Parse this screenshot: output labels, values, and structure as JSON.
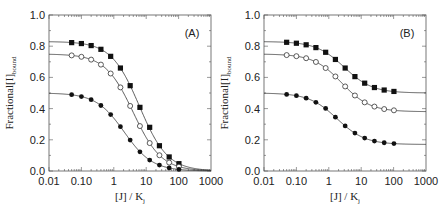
{
  "figure": {
    "panels": [
      {
        "id": "A",
        "label": "(A)"
      },
      {
        "id": "B",
        "label": "(B)"
      }
    ]
  },
  "chart_data": [
    {
      "type": "line",
      "panel_label": "(A)",
      "title": "",
      "xlabel": "[J] / K_J",
      "ylabel": "Fractional[I]_bound",
      "xscale": "log",
      "xlim": [
        0.01,
        1000
      ],
      "ylim": [
        0.0,
        1.0
      ],
      "xticks": [
        0.01,
        0.1,
        1,
        10,
        100,
        1000
      ],
      "xtick_labels": [
        "0.01",
        "0.10",
        "1",
        "10",
        "100",
        "1000"
      ],
      "yticks": [
        0.0,
        0.2,
        0.4,
        0.6,
        0.8,
        1.0
      ],
      "ytick_labels": [
        "0.0",
        "0.2",
        "0.4",
        "0.6",
        "0.8",
        "1.0"
      ],
      "grid": false,
      "legend": null,
      "x": [
        0.05,
        0.1,
        0.2,
        0.4,
        0.8,
        1.6,
        3.2,
        6.4,
        12.8,
        25.6,
        51.2,
        102.4
      ],
      "series": [
        {
          "name": "filled squares",
          "marker": "square-filled",
          "plateau": 0.83,
          "floor": 0.0,
          "midpoint": 6.2,
          "values": [
            0.823,
            0.817,
            0.804,
            0.78,
            0.735,
            0.66,
            0.547,
            0.408,
            0.28,
            0.162,
            0.09,
            0.047
          ]
        },
        {
          "name": "open circles",
          "marker": "circle-open",
          "plateau": 0.75,
          "floor": 0.0,
          "midpoint": 4.0,
          "values": [
            0.741,
            0.732,
            0.714,
            0.682,
            0.625,
            0.536,
            0.417,
            0.288,
            0.179,
            0.101,
            0.054,
            0.028
          ]
        },
        {
          "name": "filled circles",
          "marker": "circle-filled",
          "plateau": 0.5,
          "floor": 0.0,
          "midpoint": 2.1,
          "values": [
            0.489,
            0.477,
            0.457,
            0.42,
            0.362,
            0.284,
            0.198,
            0.123,
            0.07,
            0.038,
            0.02,
            0.01
          ]
        }
      ]
    },
    {
      "type": "line",
      "panel_label": "(B)",
      "title": "",
      "xlabel": "[J] / K_J",
      "ylabel": "Fractional[I]_bound",
      "xscale": "log",
      "xlim": [
        0.01,
        1000
      ],
      "ylim": [
        0.0,
        1.0
      ],
      "xticks": [
        0.01,
        0.1,
        1,
        10,
        100,
        1000
      ],
      "xtick_labels": [
        "0.01",
        "0.10",
        "1",
        "10",
        "100",
        "1000"
      ],
      "yticks": [
        0.0,
        0.2,
        0.4,
        0.6,
        0.8,
        1.0
      ],
      "ytick_labels": [
        "0.0",
        "0.2",
        "0.4",
        "0.6",
        "0.8",
        "1.0"
      ],
      "grid": false,
      "legend": null,
      "x": [
        0.05,
        0.1,
        0.2,
        0.4,
        0.8,
        1.6,
        3.2,
        6.4,
        12.8,
        25.6,
        51.2,
        102.4
      ],
      "series": [
        {
          "name": "filled squares",
          "marker": "square-filled",
          "plateau": 0.83,
          "floor": 0.5,
          "midpoint": 3.0,
          "values": [
            0.825,
            0.819,
            0.809,
            0.791,
            0.761,
            0.715,
            0.66,
            0.605,
            0.563,
            0.535,
            0.519,
            0.51
          ]
        },
        {
          "name": "open circles",
          "marker": "circle-open",
          "plateau": 0.75,
          "floor": 0.38,
          "midpoint": 2.5,
          "values": [
            0.743,
            0.736,
            0.723,
            0.699,
            0.66,
            0.606,
            0.542,
            0.484,
            0.44,
            0.413,
            0.397,
            0.389
          ]
        },
        {
          "name": "filled circles",
          "marker": "circle-filled",
          "plateau": 0.5,
          "floor": 0.17,
          "midpoint": 1.8,
          "values": [
            0.491,
            0.483,
            0.467,
            0.44,
            0.401,
            0.345,
            0.289,
            0.243,
            0.211,
            0.192,
            0.181,
            0.176
          ]
        }
      ]
    }
  ]
}
